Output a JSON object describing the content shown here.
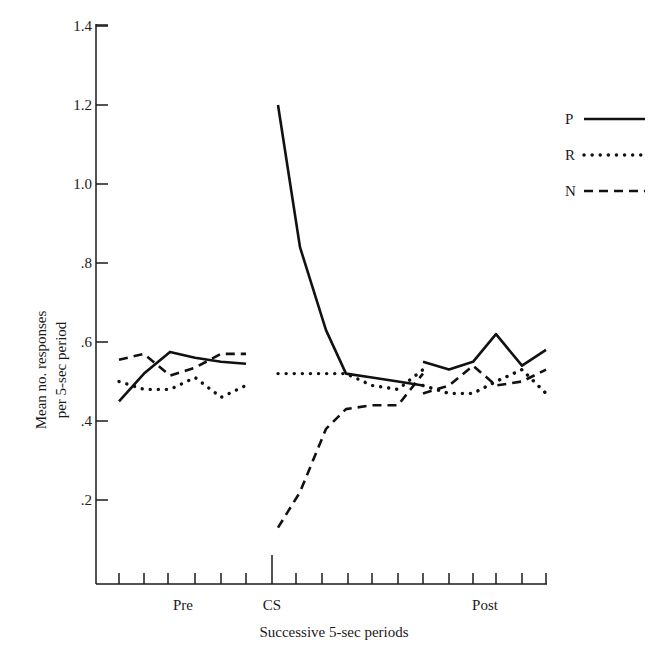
{
  "chart_data": {
    "type": "line",
    "title": "",
    "xlabel": "Successive 5-sec periods",
    "ylabel": "Mean no. responses per 5-sec period",
    "ylabel_lines": [
      "Mean no. responses",
      "per 5-sec period"
    ],
    "ylim": [
      0,
      1.4
    ],
    "yticks": [
      {
        "value": 0.2,
        "label": ".2"
      },
      {
        "value": 0.4,
        "label": ".4"
      },
      {
        "value": 0.6,
        "label": ".6"
      },
      {
        "value": 0.8,
        "label": ".8"
      },
      {
        "value": 1.0,
        "label": "1.0"
      },
      {
        "value": 1.2,
        "label": "1.2"
      },
      {
        "value": 1.4,
        "label": "1.4"
      }
    ],
    "grid": false,
    "legend_position": "right",
    "period_labels": [
      {
        "label": "Pre",
        "x": 183
      },
      {
        "label": "CS",
        "x": 272
      },
      {
        "label": "Post",
        "x": 485
      }
    ],
    "x_tick_px": [
      119,
      144,
      168,
      195,
      221,
      246,
      272,
      296,
      322,
      348,
      372,
      398,
      423,
      449,
      473,
      496,
      522,
      546
    ],
    "segments": [
      {
        "name": "Pre",
        "x_px": [
          119,
          144,
          170,
          195,
          221,
          246
        ]
      },
      {
        "name": "CS",
        "x_px": [
          278,
          300,
          326,
          346,
          372,
          398,
          423
        ]
      },
      {
        "name": "Post",
        "x_px": [
          423,
          449,
          473,
          496,
          522,
          546
        ]
      }
    ],
    "series": [
      {
        "name": "P",
        "style": "solid",
        "pre": [
          0.45,
          0.52,
          0.575,
          0.56,
          0.55,
          0.545
        ],
        "cs": [
          1.2,
          0.84,
          0.63,
          0.52,
          0.51,
          0.5,
          0.49
        ],
        "post": [
          0.55,
          0.53,
          0.55,
          0.62,
          0.54,
          0.58
        ]
      },
      {
        "name": "R",
        "style": "dotted",
        "pre": [
          0.5,
          0.48,
          0.48,
          0.51,
          0.46,
          0.49
        ],
        "cs": [
          0.52,
          0.52,
          0.52,
          0.52,
          0.49,
          0.48,
          0.53
        ],
        "post": [
          0.49,
          0.47,
          0.47,
          0.5,
          0.53,
          0.47
        ]
      },
      {
        "name": "N",
        "style": "dashed",
        "pre": [
          0.555,
          0.57,
          0.515,
          0.535,
          0.57,
          0.57
        ],
        "cs": [
          0.13,
          0.22,
          0.38,
          0.43,
          0.44,
          0.44,
          0.52
        ],
        "post": [
          0.47,
          0.49,
          0.54,
          0.49,
          0.5,
          0.53
        ]
      }
    ],
    "legend": [
      {
        "label": "P",
        "style": "solid"
      },
      {
        "label": "R",
        "style": "dotted"
      },
      {
        "label": "N",
        "style": "dashed"
      }
    ]
  }
}
